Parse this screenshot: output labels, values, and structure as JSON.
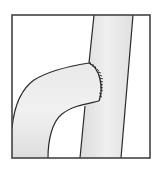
{
  "figure": {
    "colors": {
      "background": "#ffffff",
      "frame": "#444444",
      "vessel_fill": "#e4e4e4",
      "vessel_highlight": "#f2f2f2",
      "outline": "#2a2a2a",
      "sutures": "#222222"
    },
    "elements": [
      {
        "id": "frame",
        "label": "Border frame"
      },
      {
        "id": "recipient-vessel",
        "label": "Vertical recipient vessel"
      },
      {
        "id": "graft-vessel",
        "label": "Curved graft vessel"
      },
      {
        "id": "anastomosis-sutures",
        "label": "Suture line at anastomosis"
      }
    ]
  }
}
